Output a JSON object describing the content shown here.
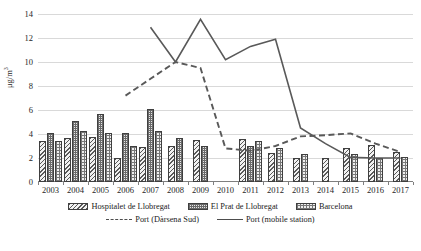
{
  "chart_data": {
    "type": "bar",
    "title": "",
    "xlabel": "",
    "ylabel": "μg/m³",
    "ylim": [
      0,
      14
    ],
    "yticks": [
      0,
      2,
      4,
      6,
      8,
      10,
      12,
      14
    ],
    "grid": true,
    "legend_position": "bottom",
    "categories": [
      "2003",
      "2004",
      "2005",
      "2006",
      "2007",
      "2008",
      "2009",
      "2010",
      "2011",
      "2012",
      "2013",
      "2014",
      "2015",
      "2016",
      "2017"
    ],
    "series": [
      {
        "name": "Hospitalet de Llobregat",
        "kind": "bar",
        "pattern": "diagonal-hatch",
        "values": [
          3.4,
          3.7,
          3.75,
          2.0,
          2.9,
          3.0,
          3.5,
          null,
          3.6,
          2.45,
          2.0,
          2.0,
          2.85,
          3.1,
          2.5
        ]
      },
      {
        "name": "El Prat de Llobregat",
        "kind": "bar",
        "pattern": "fine-grid",
        "values": [
          4.1,
          5.1,
          5.7,
          4.1,
          6.1,
          3.7,
          3.0,
          null,
          3.0,
          null,
          null,
          null,
          null,
          null,
          null
        ]
      },
      {
        "name": "Barcelona",
        "kind": "bar",
        "pattern": "coarse-grid",
        "values": [
          3.4,
          4.25,
          4.1,
          3.0,
          4.25,
          null,
          null,
          null,
          3.45,
          2.8,
          2.35,
          null,
          2.3,
          2.0,
          2.1
        ]
      },
      {
        "name": "Port (Dàrsena Sud)",
        "kind": "line",
        "style": "dashed",
        "values": [
          null,
          null,
          null,
          7.2,
          8.6,
          10.0,
          9.5,
          2.8,
          2.6,
          3.0,
          3.8,
          3.9,
          4.05,
          3.2,
          2.5
        ]
      },
      {
        "name": "Port (mobile station)",
        "kind": "line",
        "style": "solid",
        "values": [
          null,
          null,
          null,
          null,
          12.9,
          10.0,
          13.55,
          10.2,
          11.3,
          11.9,
          4.5,
          3.2,
          2.05,
          2.0,
          2.0
        ]
      }
    ]
  },
  "axis": {
    "y_title": "μg/m³",
    "y_title_base": "μg/m",
    "y_title_exp": "3"
  },
  "legend": {
    "row1": [
      {
        "label": "Hospitalet de Llobregat",
        "swatch": "hatch-swatch"
      },
      {
        "label": "El Prat de Llobregat",
        "swatch": "fine-grid-swatch"
      },
      {
        "label": "Barcelona",
        "swatch": "coarse-grid-swatch"
      }
    ],
    "row2": [
      {
        "label": "Port (Dàrsena Sud)",
        "swatch": "dashed-line-swatch"
      },
      {
        "label": "Port (mobile station)",
        "swatch": "solid-line-swatch"
      }
    ]
  },
  "caption": ""
}
